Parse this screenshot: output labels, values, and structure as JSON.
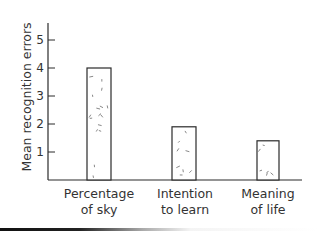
{
  "chart_data": {
    "type": "bar",
    "title": "",
    "xlabel": "",
    "ylabel": "Mean recognition errors",
    "categories": [
      "Percentage of sky",
      "Intention to learn",
      "Meaning of life"
    ],
    "category_lines": [
      [
        "Percentage",
        "of sky"
      ],
      [
        "Intention",
        "to learn"
      ],
      [
        "Meaning",
        "of life"
      ]
    ],
    "values": [
      4.0,
      1.9,
      1.4
    ],
    "yticks": [
      1,
      2,
      3,
      4,
      5
    ],
    "ylim": [
      0,
      5.6
    ],
    "grid": false,
    "legend": null,
    "bar_style": "white fill with sparse dash stipple, black outline"
  },
  "colors": {
    "axis": "#2a2a2a",
    "bar_outline": "#2a2a2a",
    "bar_fill": "#ffffff",
    "stipple": "#555555"
  }
}
